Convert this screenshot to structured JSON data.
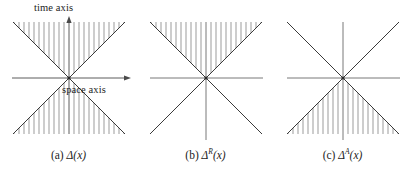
{
  "figure": {
    "background_color": "#ffffff",
    "line_color": "#333333",
    "hatch_color": "#8a8a8a",
    "text_color": "#1d1d1d"
  },
  "axis_labels": {
    "time": "time axis",
    "space": "space axis"
  },
  "panels": [
    {
      "id": "a",
      "caption_index": "(a)",
      "caption_symbol": "Δ",
      "caption_superscript": "",
      "caption_argument": "(x)",
      "caption_full": "(a) Δ(x)",
      "hatched_regions": [
        "upper-cone",
        "lower-cone"
      ],
      "show_arrows": true,
      "show_axis_labels": true,
      "hatch_line_count": 23
    },
    {
      "id": "b",
      "caption_index": "(b)",
      "caption_symbol": "Δ",
      "caption_superscript": "R",
      "caption_argument": "(x)",
      "caption_full": "(b) Δᴿ(x)",
      "hatched_regions": [
        "upper-cone"
      ],
      "show_arrows": false,
      "show_axis_labels": false,
      "hatch_line_count": 23
    },
    {
      "id": "c",
      "caption_index": "(c)",
      "caption_symbol": "Δ",
      "caption_superscript": "A",
      "caption_argument": "(x)",
      "caption_full": "(c) Δᴬ(x)",
      "hatched_regions": [
        "lower-cone"
      ],
      "show_arrows": false,
      "show_axis_labels": false,
      "hatch_line_count": 23
    }
  ]
}
